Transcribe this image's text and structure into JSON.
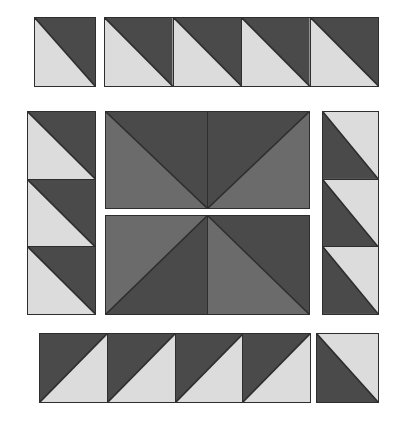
{
  "figure": {
    "type": "quilt-block-diagram",
    "canvas": {
      "width": 405,
      "height": 421,
      "background": "#ffffff"
    },
    "palette": {
      "light": "#dcdcdc",
      "medium": "#6b6b6b",
      "dark": "#4a4a4a",
      "outline": "#2e2e2e"
    },
    "groups": [
      {
        "name": "top-left-single",
        "label": "Top row corner tile",
        "x": 34,
        "y": 17,
        "width": 62,
        "height": 70,
        "orientation": "horizontal",
        "tiles": [
          {
            "name": "tile-top-corner-1",
            "split": "diagonal-tlbr",
            "upper": "dark",
            "lower": "light"
          }
        ]
      },
      {
        "name": "top-strip",
        "label": "Top row four-tile strip",
        "x": 104,
        "y": 17,
        "width": 275,
        "height": 70,
        "orientation": "horizontal",
        "tiles": [
          {
            "name": "tile-top-strip-1",
            "split": "diagonal-tlbr",
            "upper": "dark",
            "lower": "light"
          },
          {
            "name": "tile-top-strip-2",
            "split": "diagonal-tlbr",
            "upper": "dark",
            "lower": "light"
          },
          {
            "name": "tile-top-strip-3",
            "split": "diagonal-tlbr",
            "upper": "dark",
            "lower": "light"
          },
          {
            "name": "tile-top-strip-4",
            "split": "diagonal-tlbr",
            "upper": "dark",
            "lower": "light"
          }
        ]
      },
      {
        "name": "left-column",
        "label": "Left side three-tile column",
        "x": 27,
        "y": 111,
        "width": 69,
        "height": 204,
        "orientation": "vertical",
        "tiles": [
          {
            "name": "tile-left-col-1",
            "split": "diagonal-tlbr",
            "upper": "dark",
            "lower": "light"
          },
          {
            "name": "tile-left-col-2",
            "split": "diagonal-tlbr",
            "upper": "dark",
            "lower": "light"
          },
          {
            "name": "tile-left-col-3",
            "split": "diagonal-tlbr",
            "upper": "dark",
            "lower": "light"
          }
        ]
      },
      {
        "name": "center-top-pair",
        "label": "Center upper pinwheel half",
        "x": 105,
        "y": 111,
        "width": 205,
        "height": 98,
        "orientation": "horizontal",
        "tiles": [
          {
            "name": "tile-center-tl",
            "split": "diagonal-tlbr",
            "upper": "dark",
            "lower": "medium"
          },
          {
            "name": "tile-center-tr",
            "split": "diagonal-bltr",
            "upper": "dark",
            "lower": "medium"
          }
        ]
      },
      {
        "name": "center-bottom-pair",
        "label": "Center lower pinwheel half",
        "x": 105,
        "y": 215,
        "width": 205,
        "height": 100,
        "orientation": "horizontal",
        "tiles": [
          {
            "name": "tile-center-bl",
            "split": "diagonal-bltr",
            "upper": "medium",
            "lower": "dark"
          },
          {
            "name": "tile-center-br",
            "split": "diagonal-tlbr",
            "upper": "dark",
            "lower": "medium"
          }
        ]
      },
      {
        "name": "right-column",
        "label": "Right side three-tile column",
        "x": 322,
        "y": 111,
        "width": 57,
        "height": 204,
        "orientation": "vertical",
        "tiles": [
          {
            "name": "tile-right-col-1",
            "split": "diagonal-tlbr",
            "upper": "light",
            "lower": "dark"
          },
          {
            "name": "tile-right-col-2",
            "split": "diagonal-tlbr",
            "upper": "light",
            "lower": "dark"
          },
          {
            "name": "tile-right-col-3",
            "split": "diagonal-tlbr",
            "upper": "light",
            "lower": "dark"
          }
        ]
      },
      {
        "name": "bottom-strip",
        "label": "Bottom row four-tile strip",
        "x": 39,
        "y": 333,
        "width": 272,
        "height": 70,
        "orientation": "horizontal",
        "tiles": [
          {
            "name": "tile-bottom-strip-1",
            "split": "diagonal-bltr",
            "upper": "dark",
            "lower": "light"
          },
          {
            "name": "tile-bottom-strip-2",
            "split": "diagonal-bltr",
            "upper": "dark",
            "lower": "light"
          },
          {
            "name": "tile-bottom-strip-3",
            "split": "diagonal-bltr",
            "upper": "dark",
            "lower": "light"
          },
          {
            "name": "tile-bottom-strip-4",
            "split": "diagonal-bltr",
            "upper": "dark",
            "lower": "light"
          }
        ]
      },
      {
        "name": "bottom-right-single",
        "label": "Bottom row corner tile",
        "x": 316,
        "y": 333,
        "width": 63,
        "height": 70,
        "orientation": "horizontal",
        "tiles": [
          {
            "name": "tile-bottom-corner-1",
            "split": "diagonal-tlbr",
            "upper": "light",
            "lower": "dark"
          }
        ]
      }
    ]
  }
}
